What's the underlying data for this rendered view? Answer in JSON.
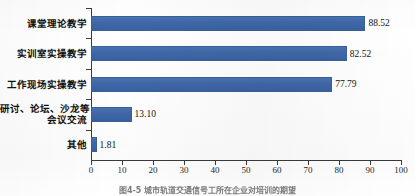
{
  "figure": {
    "caption": "图4-5  城市轨道交通信号工所在企业对培训的期望",
    "accent_color": "#3f67a8",
    "axis_color": "#3a3a3a",
    "background": "#ffffff"
  },
  "chart_data": {
    "type": "bar",
    "orientation": "horizontal",
    "title": "",
    "subtitle": "",
    "xlabel": "",
    "ylabel": "",
    "categories": [
      "课堂理论教学",
      "实训室实操教学",
      "工作现场实操教学",
      "研讨、论坛、沙龙等\n会议交流",
      "其他"
    ],
    "category_lines": [
      [
        "课堂理论教学"
      ],
      [
        "实训室实操教学"
      ],
      [
        "工作现场实操教学"
      ],
      [
        "研讨、论坛、沙龙等",
        "会议交流"
      ],
      [
        "其他"
      ]
    ],
    "values": [
      88.52,
      82.52,
      77.79,
      13.1,
      1.81
    ],
    "value_labels": [
      "88.52",
      "82.52",
      "77.79",
      "13.10",
      "1.81"
    ],
    "xlim": [
      0,
      100
    ],
    "xticks": [
      0,
      10,
      20,
      30,
      40,
      50,
      60,
      70,
      80,
      90,
      100
    ],
    "xtick_labels": [
      "0",
      "10",
      "20",
      "30",
      "40",
      "50",
      "60",
      "70",
      "80",
      "90",
      "100"
    ],
    "grid": false,
    "legend": null,
    "series_color": "#3f67a8"
  }
}
